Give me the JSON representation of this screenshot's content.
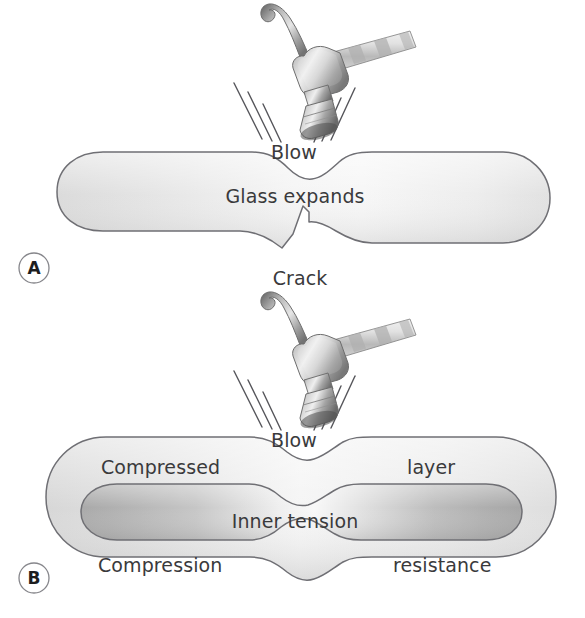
{
  "figure": {
    "background_color": "#ffffff",
    "width": 585,
    "height": 618
  },
  "palette": {
    "outline_stroke": "#6f6f74",
    "text_color": "#3a3a3c",
    "letter_color": "#1d1d1f",
    "circle_stroke": "#86868b",
    "glass_fill_light": "#e2e2e2",
    "glass_fill_lighter": "#f2f2f2",
    "inner_fill_dark": "#b9b9b9",
    "inner_fill_mid": "#cfcfcf",
    "speedline_stroke": "#55555a",
    "hammer_light": "#e8e8e8",
    "hammer_mid": "#b4b4b4",
    "hammer_dark": "#6a6a6a",
    "handle_light": "#efefef",
    "handle_mid": "#c2c2c2"
  },
  "panels": [
    {
      "id": "panel-a",
      "letter": "A",
      "letter_position": {
        "cx": 34,
        "cy": 268,
        "r": 15
      },
      "description": "Annealed glass cracks under a hammer blow",
      "labels": [
        {
          "name": "blow-label",
          "text": "Blow",
          "x": 294,
          "y": 159,
          "anchor": "middle",
          "size": 19
        },
        {
          "name": "glass-expands-label",
          "text": "Glass expands",
          "x": 295,
          "y": 203,
          "anchor": "middle",
          "size": 19
        },
        {
          "name": "crack-label",
          "text": "Crack",
          "x": 300,
          "y": 285,
          "anchor": "middle",
          "size": 19
        }
      ],
      "hammer": {
        "name": "hammer-icon",
        "head_center": {
          "x": 305,
          "y": 75
        },
        "strike_point": {
          "x": 302,
          "y": 128
        },
        "speed_lines_left": 3,
        "speed_lines_right": 3
      }
    },
    {
      "id": "panel-b",
      "letter": "B",
      "letter_position": {
        "cx": 34,
        "cy": 578,
        "r": 15
      },
      "description": "Tempered glass resists the blow; compressed outer layer and inner tension",
      "labels": [
        {
          "name": "blow-label",
          "text": "Blow",
          "x": 294,
          "y": 447,
          "anchor": "middle",
          "size": 19
        },
        {
          "name": "compressed-label",
          "text": "Compressed",
          "x": 101,
          "y": 474,
          "anchor": "start",
          "size": 19
        },
        {
          "name": "layer-label",
          "text": "layer",
          "x": 407,
          "y": 474,
          "anchor": "start",
          "size": 19
        },
        {
          "name": "inner-tension-label",
          "text": "Inner tension",
          "x": 295,
          "y": 528,
          "anchor": "middle",
          "size": 19
        },
        {
          "name": "compression-label",
          "text": "Compression",
          "x": 98,
          "y": 572,
          "anchor": "start",
          "size": 19
        },
        {
          "name": "resistance-label",
          "text": "resistance",
          "x": 393,
          "y": 572,
          "anchor": "start",
          "size": 19
        }
      ],
      "hammer": {
        "name": "hammer-icon",
        "head_center": {
          "x": 305,
          "y": 363
        },
        "strike_point": {
          "x": 302,
          "y": 416
        },
        "speed_lines_left": 3,
        "speed_lines_right": 3
      }
    }
  ],
  "all_text": [
    "Blow",
    "Glass expands",
    "Crack",
    "A",
    "Blow",
    "Compressed",
    "layer",
    "Inner tension",
    "Compression",
    "resistance",
    "B"
  ]
}
